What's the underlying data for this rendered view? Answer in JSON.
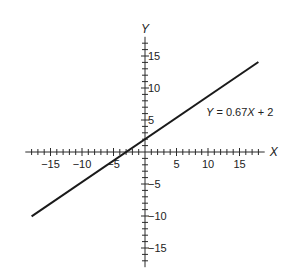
{
  "chart_data": {
    "type": "line",
    "title": "",
    "xlabel": "X",
    "ylabel": "Y",
    "xlim": [
      -19,
      19
    ],
    "ylim": [
      -18,
      18
    ],
    "minor_tick_step": 1,
    "x_tick_labels": [
      "-15",
      "-10",
      "-5",
      "5",
      "10",
      "15"
    ],
    "x_tick_values": [
      -15,
      -10,
      -5,
      5,
      10,
      15
    ],
    "y_tick_labels": [
      "15",
      "10",
      "5",
      "-5",
      "-10",
      "-15"
    ],
    "y_tick_values": [
      15,
      10,
      5,
      -5,
      -10,
      -15
    ],
    "grid": false,
    "series": [
      {
        "name": "Y = 0.67X + 2",
        "slope": 0.67,
        "intercept": 2,
        "x": [
          -18,
          18
        ],
        "y": [
          -10.06,
          14.06
        ],
        "color": "#1a1a1a"
      }
    ],
    "annotations": [
      {
        "text": "Y = 0.67X + 2",
        "parts": [
          {
            "t": "Y",
            "italic": true
          },
          {
            "t": " = 0.67",
            "italic": false
          },
          {
            "t": "X",
            "italic": true
          },
          {
            "t": " + 2",
            "italic": false
          }
        ],
        "anchor_x": 10,
        "anchor_y": 6.3
      }
    ]
  }
}
